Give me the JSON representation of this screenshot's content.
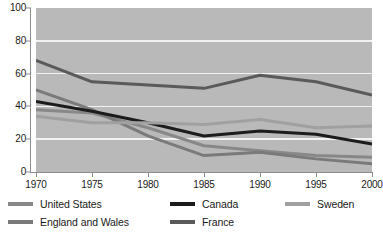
{
  "chart_data": {
    "type": "line",
    "title": "",
    "xlabel": "",
    "ylabel": "",
    "x": [
      1970,
      1975,
      1980,
      1985,
      1990,
      1995,
      2000
    ],
    "xtick_labels": [
      "1970",
      "1975",
      "1980",
      "1985",
      "1990",
      "1995",
      "2000"
    ],
    "ytick_labels": [
      "0",
      "20",
      "40",
      "60",
      "80",
      "100"
    ],
    "yticks": [
      0,
      20,
      40,
      60,
      80,
      100
    ],
    "ylim": [
      0,
      100
    ],
    "xlim": [
      1970,
      2000
    ],
    "grid": "horizontal",
    "legend_position": "below",
    "plot_background": "#b9b9b9",
    "gridline_color": "#f2f2f2",
    "series": [
      {
        "name": "United States",
        "color": "#888888",
        "values": [
          38,
          36,
          27,
          16,
          13,
          10,
          9
        ]
      },
      {
        "name": "England and Wales",
        "color": "#7a7a7a",
        "values": [
          50,
          38,
          22,
          10,
          12,
          8,
          5
        ]
      },
      {
        "name": "Canada",
        "color": "#1c1c1c",
        "values": [
          43,
          37,
          30,
          22,
          25,
          23,
          17
        ]
      },
      {
        "name": "France",
        "color": "#5a5a5a",
        "values": [
          68,
          55,
          53,
          51,
          59,
          55,
          47
        ]
      },
      {
        "name": "Sweden",
        "color": "#a0a0a0",
        "values": [
          34,
          30,
          30,
          29,
          32,
          27,
          28
        ]
      }
    ]
  },
  "legend": {
    "items": [
      {
        "label": "United States",
        "color": "#888888"
      },
      {
        "label": "Canada",
        "color": "#1c1c1c"
      },
      {
        "label": "Sweden",
        "color": "#a0a0a0"
      },
      {
        "label": "England and Wales",
        "color": "#7a7a7a"
      },
      {
        "label": "France",
        "color": "#5a5a5a"
      }
    ]
  }
}
